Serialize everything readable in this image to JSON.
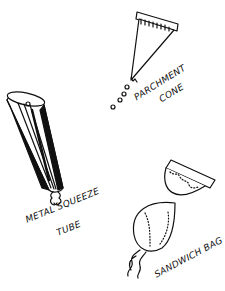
{
  "illustration": {
    "items": [
      {
        "id": "parchment-cone",
        "label_line1": "PARCHMENT",
        "label_line2": "CONE"
      },
      {
        "id": "metal-squeeze-tube",
        "label_line1": "METAL SQUEEZE",
        "label_line2": "TUBE"
      },
      {
        "id": "sandwich-bag",
        "label_line1": "SANDWICH BAG"
      }
    ],
    "colors": {
      "ink": "#111111",
      "paper": "#ffffff"
    }
  }
}
